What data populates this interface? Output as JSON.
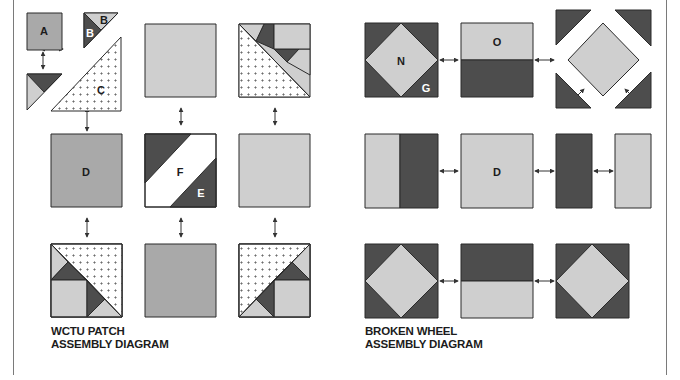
{
  "colors": {
    "dark": "#4d4d4d",
    "medium": "#a9a9a9",
    "light": "#cfcfcf",
    "dotted_bg": "#ffffff",
    "outline": "#2a2a2a",
    "background": "#ffffff"
  },
  "wctu": {
    "caption_line1": "WCTU PATCH",
    "caption_line2": "ASSEMBLY DIAGRAM",
    "labels": {
      "A": "A",
      "B_light": "B",
      "B_dark": "B",
      "C": "C",
      "D": "D",
      "F": "F",
      "E": "E"
    }
  },
  "broken_wheel": {
    "caption_line1": "BROKEN WHEEL",
    "caption_line2": "ASSEMBLY DIAGRAM",
    "labels": {
      "N": "N",
      "G": "G",
      "O": "O",
      "D": "D"
    }
  }
}
